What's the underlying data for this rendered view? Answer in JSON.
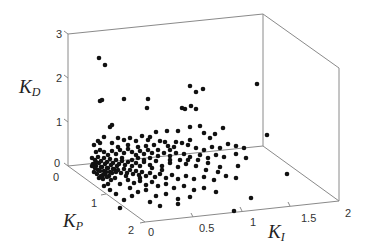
{
  "chart_data": {
    "type": "scatter",
    "dimensions": 3,
    "title": "",
    "axes": {
      "x": {
        "label": "K_I",
        "label_main": "K",
        "label_sub": "I",
        "range": [
          0,
          2
        ],
        "ticks": [
          "0",
          "0.5",
          "1",
          "1.5",
          "2"
        ]
      },
      "y": {
        "label": "K_P",
        "label_main": "K",
        "label_sub": "P",
        "range": [
          0,
          2
        ],
        "ticks": [
          "0",
          "1",
          "2"
        ]
      },
      "z": {
        "label": "K_D",
        "label_main": "K",
        "label_sub": "D",
        "range": [
          0,
          3
        ],
        "ticks": [
          "0",
          "1",
          "2",
          "3"
        ]
      }
    },
    "grid": false,
    "legend": null,
    "marker": {
      "color": "#111111",
      "size": 2.3
    },
    "box_color": "#8a8a8a",
    "note": "Points given as projected screen coordinates [x, y] in a 371x250 view; dense cluster near K_I≈0, K_P≈0–0.5, K_D≈0–0.3",
    "points_screen": [
      [
        99,
        58
      ],
      [
        105,
        65
      ],
      [
        100,
        101
      ],
      [
        102,
        100
      ],
      [
        124,
        99
      ],
      [
        148,
        99
      ],
      [
        147,
        108
      ],
      [
        182,
        108
      ],
      [
        185,
        109
      ],
      [
        191,
        106
      ],
      [
        196,
        109
      ],
      [
        190,
        86
      ],
      [
        196,
        92
      ],
      [
        203,
        89
      ],
      [
        257,
        84
      ],
      [
        267,
        135
      ],
      [
        251,
        198
      ],
      [
        234,
        211
      ],
      [
        287,
        174
      ],
      [
        110,
        127
      ],
      [
        112,
        125
      ],
      [
        150,
        137
      ],
      [
        156,
        132
      ],
      [
        167,
        131
      ],
      [
        178,
        131
      ],
      [
        190,
        127
      ],
      [
        200,
        126
      ],
      [
        204,
        133
      ],
      [
        210,
        138
      ],
      [
        190,
        140
      ],
      [
        215,
        134
      ],
      [
        223,
        128
      ],
      [
        176,
        142
      ],
      [
        165,
        142
      ],
      [
        170,
        150
      ],
      [
        94,
        145
      ],
      [
        100,
        143
      ],
      [
        104,
        137
      ],
      [
        98,
        141
      ],
      [
        112,
        143
      ],
      [
        118,
        138
      ],
      [
        124,
        140
      ],
      [
        130,
        138
      ],
      [
        136,
        141
      ],
      [
        142,
        136
      ],
      [
        148,
        140
      ],
      [
        154,
        145
      ],
      [
        160,
        141
      ],
      [
        168,
        146
      ],
      [
        174,
        147
      ],
      [
        182,
        143
      ],
      [
        188,
        145
      ],
      [
        196,
        148
      ],
      [
        204,
        150
      ],
      [
        212,
        147
      ],
      [
        220,
        148
      ],
      [
        228,
        144
      ],
      [
        236,
        146
      ],
      [
        244,
        148
      ],
      [
        96,
        152
      ],
      [
        100,
        150
      ],
      [
        104,
        152
      ],
      [
        108,
        155
      ],
      [
        112,
        151
      ],
      [
        116,
        154
      ],
      [
        120,
        150
      ],
      [
        124,
        153
      ],
      [
        128,
        149
      ],
      [
        132,
        152
      ],
      [
        136,
        155
      ],
      [
        140,
        151
      ],
      [
        144,
        154
      ],
      [
        148,
        150
      ],
      [
        152,
        153
      ],
      [
        158,
        150
      ],
      [
        164,
        153
      ],
      [
        170,
        156
      ],
      [
        176,
        153
      ],
      [
        184,
        154
      ],
      [
        190,
        157
      ],
      [
        200,
        155
      ],
      [
        208,
        158
      ],
      [
        216,
        155
      ],
      [
        224,
        157
      ],
      [
        236,
        154
      ],
      [
        246,
        158
      ],
      [
        92,
        158
      ],
      [
        95,
        160
      ],
      [
        98,
        157
      ],
      [
        101,
        161
      ],
      [
        104,
        158
      ],
      [
        107,
        162
      ],
      [
        110,
        159
      ],
      [
        113,
        163
      ],
      [
        116,
        160
      ],
      [
        119,
        164
      ],
      [
        122,
        161
      ],
      [
        125,
        165
      ],
      [
        128,
        162
      ],
      [
        132,
        166
      ],
      [
        136,
        163
      ],
      [
        140,
        166
      ],
      [
        144,
        162
      ],
      [
        150,
        165
      ],
      [
        156,
        161
      ],
      [
        162,
        166
      ],
      [
        170,
        163
      ],
      [
        178,
        167
      ],
      [
        186,
        164
      ],
      [
        196,
        166
      ],
      [
        208,
        163
      ],
      [
        220,
        167
      ],
      [
        93,
        164
      ],
      [
        96,
        166
      ],
      [
        99,
        163
      ],
      [
        102,
        167
      ],
      [
        105,
        164
      ],
      [
        108,
        168
      ],
      [
        111,
        165
      ],
      [
        114,
        169
      ],
      [
        117,
        166
      ],
      [
        95,
        168
      ],
      [
        98,
        170
      ],
      [
        101,
        167
      ],
      [
        104,
        171
      ],
      [
        107,
        168
      ],
      [
        110,
        172
      ],
      [
        113,
        169
      ],
      [
        116,
        172
      ],
      [
        94,
        172
      ],
      [
        97,
        174
      ],
      [
        100,
        171
      ],
      [
        103,
        175
      ],
      [
        106,
        172
      ],
      [
        109,
        176
      ],
      [
        112,
        173
      ],
      [
        99,
        178
      ],
      [
        103,
        179
      ],
      [
        107,
        177
      ],
      [
        111,
        180
      ],
      [
        115,
        178
      ],
      [
        101,
        176
      ],
      [
        105,
        174
      ],
      [
        96,
        162
      ],
      [
        92,
        166
      ],
      [
        118,
        170
      ],
      [
        121,
        173
      ],
      [
        124,
        169
      ],
      [
        127,
        173
      ],
      [
        130,
        170
      ],
      [
        133,
        174
      ],
      [
        136,
        171
      ],
      [
        139,
        175
      ],
      [
        142,
        172
      ],
      [
        146,
        176
      ],
      [
        150,
        173
      ],
      [
        155,
        177
      ],
      [
        160,
        174
      ],
      [
        166,
        178
      ],
      [
        172,
        175
      ],
      [
        178,
        179
      ],
      [
        186,
        176
      ],
      [
        194,
        179
      ],
      [
        204,
        177
      ],
      [
        214,
        180
      ],
      [
        128,
        180
      ],
      [
        134,
        183
      ],
      [
        140,
        181
      ],
      [
        146,
        185
      ],
      [
        152,
        182
      ],
      [
        158,
        186
      ],
      [
        166,
        184
      ],
      [
        174,
        188
      ],
      [
        184,
        186
      ],
      [
        194,
        190
      ],
      [
        204,
        188
      ],
      [
        216,
        192
      ],
      [
        130,
        188
      ],
      [
        138,
        192
      ],
      [
        146,
        190
      ],
      [
        156,
        196
      ],
      [
        166,
        194
      ],
      [
        178,
        199
      ],
      [
        190,
        197
      ],
      [
        104,
        186
      ],
      [
        110,
        190
      ],
      [
        116,
        194
      ],
      [
        124,
        200
      ],
      [
        132,
        196
      ],
      [
        120,
        208
      ],
      [
        150,
        202
      ],
      [
        160,
        206
      ],
      [
        178,
        204
      ],
      [
        140,
        178
      ],
      [
        120,
        184
      ],
      [
        126,
        176
      ],
      [
        108,
        184
      ],
      [
        152,
        168
      ],
      [
        162,
        170
      ],
      [
        144,
        160
      ],
      [
        138,
        158
      ],
      [
        150,
        158
      ],
      [
        158,
        156
      ],
      [
        132,
        160
      ],
      [
        122,
        158
      ],
      [
        118,
        147
      ],
      [
        128,
        145
      ],
      [
        138,
        147
      ],
      [
        146,
        146
      ],
      [
        170,
        160
      ],
      [
        180,
        160
      ],
      [
        188,
        160
      ],
      [
        198,
        160
      ],
      [
        206,
        170
      ],
      [
        218,
        172
      ],
      [
        226,
        176
      ],
      [
        236,
        178
      ],
      [
        238,
        166
      ]
    ]
  },
  "box": {
    "origin_back_left": [
      68,
      166
    ],
    "top_back_left": [
      68,
      34
    ],
    "top_back_mid": [
      263,
      14
    ],
    "top_right": [
      339,
      68
    ],
    "bottom_right": [
      339,
      201
    ],
    "back_bottom_mid": [
      263,
      146
    ],
    "front_corner": [
      145,
      222
    ]
  }
}
